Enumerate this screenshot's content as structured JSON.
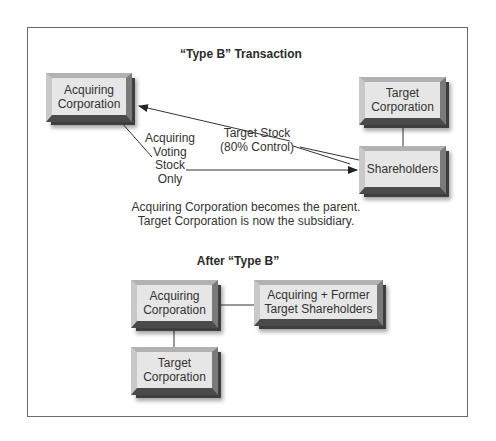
{
  "diagram": {
    "top_section": {
      "title": "“Type B” Transaction",
      "boxes": {
        "acquiring": {
          "line1": "Acquiring",
          "line2": "Corporation"
        },
        "target": {
          "line1": "Target",
          "line2": "Corporation"
        },
        "shareholders": {
          "line1": "Shareholders"
        }
      },
      "arrows": {
        "target_stock": {
          "line1": "Target Stock",
          "line2": "(80% Control)"
        },
        "acquiring_stock": {
          "line1": "Acquiring",
          "line2": "Voting",
          "line3": "Stock",
          "line4": "Only"
        }
      },
      "caption": {
        "line1": "Acquiring Corporation becomes the parent.",
        "line2": "Target Corporation is now the subsidiary."
      }
    },
    "bottom_section": {
      "title": "After “Type B”",
      "boxes": {
        "acquiring": {
          "line1": "Acquiring",
          "line2": "Corporation"
        },
        "shareholders": {
          "line1": "Acquiring + Former",
          "line2": "Target Shareholders"
        },
        "target": {
          "line1": "Target",
          "line2": "Corporation"
        }
      }
    },
    "colors": {
      "frame": "#6a6a6a",
      "box_face": "#e6e6e6",
      "line": "#333333"
    }
  }
}
